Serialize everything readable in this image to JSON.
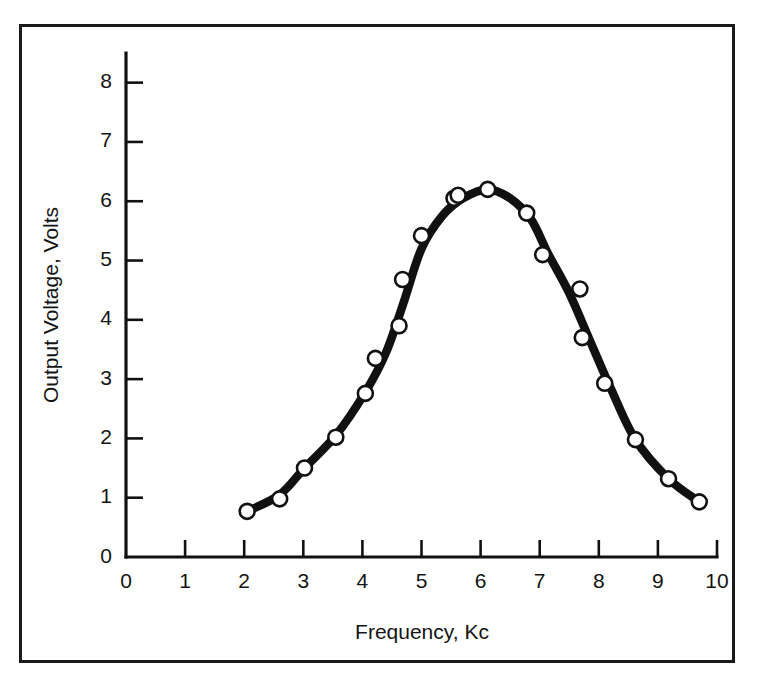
{
  "figure": {
    "background_color": "#ffffff",
    "frame_color": "#1a1a1a",
    "ink_color": "#111111"
  },
  "chart_data": {
    "type": "line",
    "title": "",
    "subtitle": "",
    "xlabel": "Frequency, Kc",
    "ylabel": "Output Voltage, Volts",
    "xlim": [
      0,
      10
    ],
    "ylim": [
      0,
      8.5
    ],
    "xticks": [
      0,
      1,
      2,
      3,
      4,
      5,
      6,
      7,
      8,
      9,
      10
    ],
    "xticklabels": [
      "0",
      "1",
      "2",
      "3",
      "4",
      "5",
      "6",
      "7",
      "8",
      "9",
      "10"
    ],
    "yticks": [
      0,
      1,
      2,
      3,
      4,
      5,
      6,
      7,
      8
    ],
    "yticklabels": [
      "0",
      "1",
      "2",
      "3",
      "4",
      "5",
      "6",
      "7",
      "8"
    ],
    "grid": false,
    "legend": null,
    "legend_position": "none",
    "tick_direction": "in",
    "marker": "open-circle",
    "series": [
      {
        "name": "Output voltage response",
        "x": [
          2.05,
          2.6,
          3.02,
          3.55,
          4.05,
          4.22,
          4.62,
          4.68,
          5.0,
          5.55,
          5.62,
          6.12,
          6.78,
          7.05,
          7.68,
          7.72,
          8.1,
          8.62,
          9.18,
          9.7
        ],
        "y": [
          0.77,
          0.98,
          1.5,
          2.02,
          2.76,
          3.35,
          3.9,
          4.68,
          5.42,
          6.05,
          6.1,
          6.2,
          5.8,
          5.1,
          4.52,
          3.7,
          2.93,
          1.98,
          1.32,
          0.93
        ]
      }
    ],
    "smoothed_curve": {
      "description": "heavy hand-drawn bell-shaped resonance curve through the plotted points",
      "x": [
        2.05,
        2.6,
        3.02,
        3.55,
        4.05,
        4.4,
        4.7,
        5.0,
        5.35,
        5.7,
        6.12,
        6.5,
        6.85,
        7.15,
        7.5,
        7.85,
        8.2,
        8.62,
        9.18,
        9.7
      ],
      "y": [
        0.77,
        1.05,
        1.5,
        2.05,
        2.78,
        3.45,
        4.3,
        5.2,
        5.75,
        6.05,
        6.2,
        6.05,
        5.7,
        5.1,
        4.45,
        3.65,
        2.85,
        1.98,
        1.32,
        0.93
      ]
    }
  }
}
